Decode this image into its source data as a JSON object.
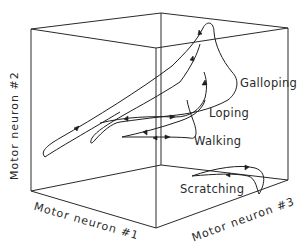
{
  "figure": {
    "type": "3d-state-space-diagram",
    "axes": {
      "x": "Motor neuron #1",
      "y": "Motor neuron #2",
      "z": "Motor neuron #3"
    },
    "trajectories": [
      {
        "label": "Galloping"
      },
      {
        "label": "Loping"
      },
      {
        "label": "Walking"
      },
      {
        "label": "Scratching"
      }
    ]
  }
}
